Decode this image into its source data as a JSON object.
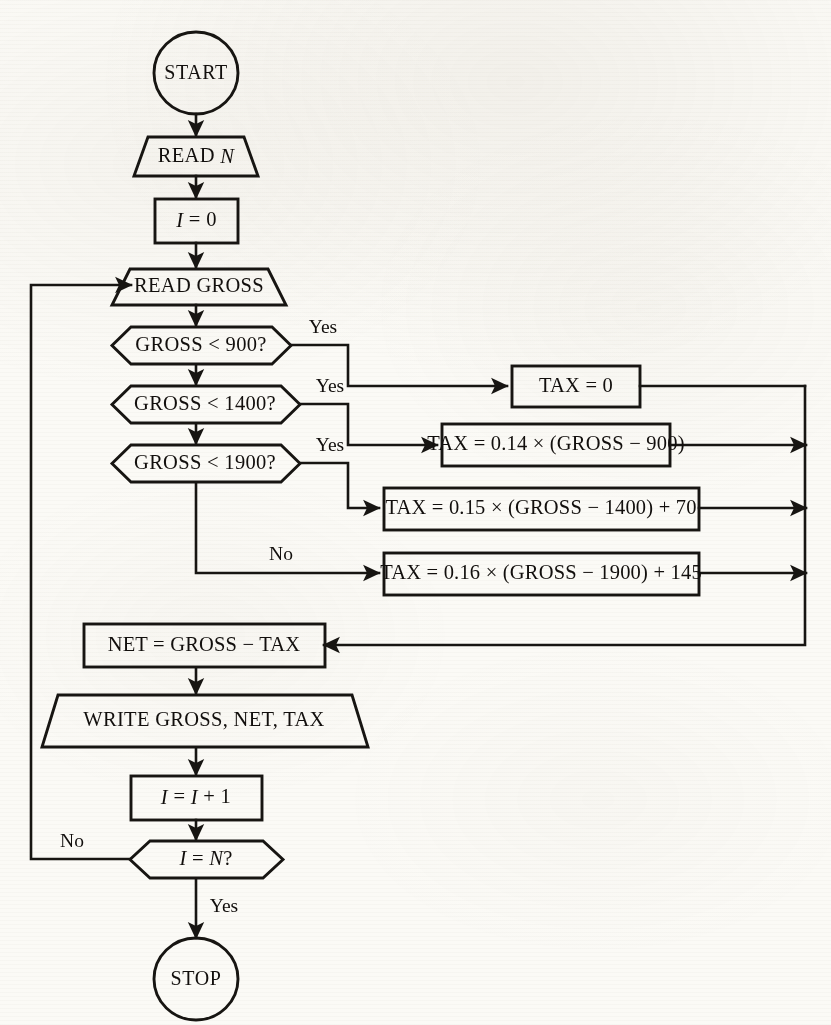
{
  "diagram": {
    "type": "flowchart",
    "colors": {
      "paper": "#fbfaf6",
      "ink": "#171512",
      "shape_fill": "#fcfbf8"
    },
    "nodes": {
      "start": {
        "shape": "circle",
        "label": "START"
      },
      "read_n": {
        "shape": "trapezoid-io",
        "label": "READ N"
      },
      "init_i": {
        "shape": "rectangle",
        "label": "I = 0"
      },
      "read_gross": {
        "shape": "trapezoid-io",
        "label": "READ GROSS"
      },
      "decision_900": {
        "shape": "hexagon",
        "label": "GROSS < 900?"
      },
      "decision_1400": {
        "shape": "hexagon",
        "label": "GROSS < 1400?"
      },
      "decision_1900": {
        "shape": "hexagon",
        "label": "GROSS < 1900?"
      },
      "tax_0": {
        "shape": "rectangle",
        "label": "TAX = 0"
      },
      "tax_14": {
        "shape": "rectangle",
        "label": "TAX = 0.14 × (GROSS − 900)"
      },
      "tax_15": {
        "shape": "rectangle",
        "label": "TAX = 0.15 × (GROSS − 1400) + 70"
      },
      "tax_16": {
        "shape": "rectangle",
        "label": "TAX = 0.16 × (GROSS − 1900) + 145"
      },
      "net": {
        "shape": "rectangle",
        "label": "NET = GROSS − TAX"
      },
      "write": {
        "shape": "trapezoid-io",
        "label": "WRITE  GROSS,  NET,  TAX"
      },
      "increment_i": {
        "shape": "rectangle",
        "label": "I = I + 1"
      },
      "decision_loop": {
        "shape": "hexagon",
        "label": "I = N?"
      },
      "stop": {
        "shape": "circle",
        "label": "STOP"
      }
    },
    "branch_labels": {
      "yes_900": "Yes",
      "yes_1400": "Yes",
      "yes_1900": "Yes",
      "no_1900": "No",
      "no_loop": "No",
      "yes_loop": "Yes"
    }
  }
}
